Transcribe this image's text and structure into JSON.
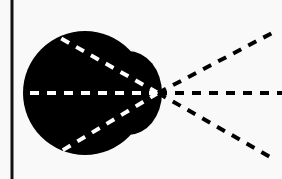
{
  "diagram": {
    "type": "ray-fan-from-lens",
    "colors": {
      "background": "#f9f9f9",
      "shape_fill": "#000000",
      "inner_dashes": "#ffffff",
      "outer_dashes": "#000000",
      "boundary_line": "#111111"
    },
    "boundary_line": {
      "x": 12,
      "y1": 0,
      "y2": 179
    },
    "focal_point": {
      "x": 158,
      "y": 93
    },
    "body": {
      "cx": 85,
      "cy": 93,
      "r": 62
    },
    "bump": {
      "cx": 128,
      "cy": 93,
      "rx": 34,
      "ry": 42
    },
    "inner_rays": [
      {
        "x": 55,
        "y": 35
      },
      {
        "x": 22,
        "y": 93
      },
      {
        "x": 58,
        "y": 153
      }
    ],
    "outer_rays": [
      {
        "x": 274,
        "y": 32
      },
      {
        "x": 282,
        "y": 93
      },
      {
        "x": 272,
        "y": 158
      }
    ]
  }
}
